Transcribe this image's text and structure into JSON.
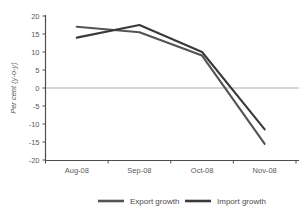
{
  "chart_data": {
    "type": "line",
    "title": "",
    "xlabel": "",
    "ylabel": "Per cent (y-o-y)",
    "categories": [
      "Aug-08",
      "Sep-08",
      "Oct-08",
      "Nov-08"
    ],
    "ylim": [
      -20,
      20
    ],
    "yticks": [
      20,
      15,
      10,
      5,
      0,
      -5,
      -10,
      -15,
      -20
    ],
    "ytick_labels": [
      "20",
      "15",
      "10",
      "5",
      "0",
      "-5",
      "-10",
      "-15",
      "-20"
    ],
    "grid": false,
    "zero_line": true,
    "legend_position": "bottom",
    "series": [
      {
        "name": "Export growth",
        "color": "#545454",
        "values": [
          17.0,
          15.5,
          9.0,
          -15.5
        ]
      },
      {
        "name": "Import growth",
        "color": "#3a3a3a",
        "values": [
          14.0,
          17.5,
          10.0,
          -11.5
        ]
      }
    ]
  },
  "legend": {
    "items": [
      {
        "label": "Export growth",
        "color": "#545454"
      },
      {
        "label": "Import growth",
        "color": "#3a3a3a"
      }
    ]
  },
  "axes": {
    "axis_color": "#4d4d4d",
    "zero_line_color": "#c9c9c9",
    "tick_text_color": "#5a5a5a"
  }
}
